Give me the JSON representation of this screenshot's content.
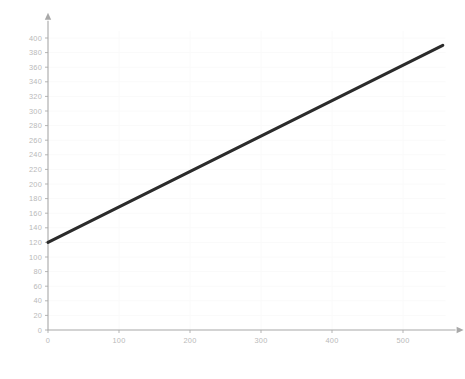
{
  "chart_data": {
    "type": "line",
    "title": "",
    "xlabel": "",
    "ylabel": "",
    "xlim": [
      0,
      560
    ],
    "ylim": [
      0,
      410
    ],
    "grid": true,
    "legend": null,
    "x_ticks": [
      0,
      100,
      200,
      300,
      400,
      500
    ],
    "x_tick_labels": [
      "0",
      "100",
      "200",
      "300",
      "400",
      "500"
    ],
    "y_ticks": [
      0,
      20,
      40,
      60,
      80,
      100,
      120,
      140,
      160,
      180,
      200,
      220,
      240,
      260,
      280,
      300,
      320,
      340,
      360,
      380,
      400
    ],
    "y_tick_labels": [
      "0",
      "20",
      "40",
      "60",
      "80",
      "100",
      "120",
      "140",
      "160",
      "180",
      "200",
      "220",
      "240",
      "260",
      "280",
      "300",
      "320",
      "340",
      "360",
      "380",
      "400"
    ],
    "series": [
      {
        "name": "series-1",
        "color": "#2b2b2b",
        "x": [
          0,
          556
        ],
        "y": [
          120,
          390
        ]
      }
    ],
    "axis_color": "#a8a8a8",
    "grid_color": "#fafafa",
    "tick_label_color": "#b9b9b9",
    "background_color": "#ffffff"
  },
  "axes": {
    "x_axis_name": "x-axis",
    "y_axis_name": "y-axis",
    "x_arrow": true,
    "y_arrow": true
  }
}
